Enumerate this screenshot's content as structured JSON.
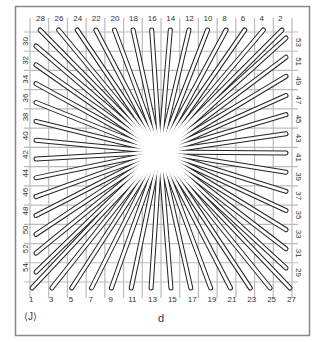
{
  "figure": {
    "caption": "d",
    "corner_mark": "⟨J⟩",
    "colors": {
      "line": "#222222",
      "frame": "#888888",
      "grid": "#aaaaaa",
      "string_fill": "#ffffff"
    }
  },
  "pins": {
    "top": [
      "28",
      "26",
      "24",
      "22",
      "20",
      "18",
      "16",
      "14",
      "12",
      "10",
      "8",
      "6",
      "4",
      "2"
    ],
    "bottom": [
      "1",
      "3",
      "5",
      "7",
      "9",
      "11",
      "13",
      "15",
      "17",
      "19",
      "21",
      "23",
      "25",
      "27"
    ],
    "left": [
      "30",
      "32",
      "34",
      "36",
      "38",
      "40",
      "42",
      "44",
      "46",
      "48",
      "50",
      "52",
      "54"
    ],
    "right": [
      "53",
      "51",
      "49",
      "47",
      "45",
      "43",
      "41",
      "39",
      "37",
      "35",
      "33",
      "31",
      "29"
    ]
  },
  "center": {
    "x": 160,
    "y": 152
  }
}
